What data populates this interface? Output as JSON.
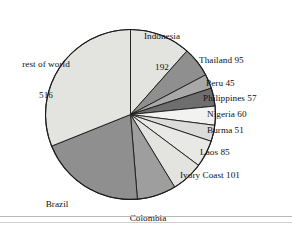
{
  "chart_data": {
    "type": "pie",
    "title": "",
    "subtitle": "",
    "xlabel": "",
    "ylabel": "",
    "legend_position": "none",
    "grid": false,
    "total": 1661,
    "units": "",
    "start_angle_deg": 0,
    "direction": "clockwise",
    "categories": [
      "Indonesia",
      "Thailand",
      "Peru",
      "Philippines",
      "Nigeria",
      "Burma",
      "Laos",
      "Ivory Coast",
      "Colombia",
      "Brazil",
      "rest of world"
    ],
    "values": [
      192,
      95,
      45,
      57,
      60,
      51,
      85,
      101,
      123,
      336,
      516
    ],
    "slice_colors": [
      "#e3e3e0",
      "#8f8f8f",
      "#a8a8a8",
      "#6e6e6e",
      "#f2f2f0",
      "#dcdcda",
      "#e8e8e6",
      "#e3e3e0",
      "#9e9e9e",
      "#8f8f8f",
      "#e3e3e0"
    ],
    "slice_edge_color": "#1a1a1a"
  },
  "labels": [
    {
      "name": "Indonesia",
      "value": "192",
      "line1": "Indonesia",
      "line2": "192"
    },
    {
      "name": "Thailand",
      "value": "95",
      "line1": "Thailand 95",
      "line2": ""
    },
    {
      "name": "Peru",
      "value": "45",
      "line1": "Peru 45",
      "line2": ""
    },
    {
      "name": "Philippines",
      "value": "57",
      "line1": "Philippines 57",
      "line2": ""
    },
    {
      "name": "Nigeria",
      "value": "60",
      "line1": "Nigeria 60",
      "line2": ""
    },
    {
      "name": "Burma",
      "value": "51",
      "line1": "Burma 51",
      "line2": ""
    },
    {
      "name": "Laos",
      "value": "85",
      "line1": "Laos 85",
      "line2": ""
    },
    {
      "name": "Ivory Coast",
      "value": "101",
      "line1": "Ivory Coast 101",
      "line2": ""
    },
    {
      "name": "Colombia",
      "value": "123",
      "line1": "Colombia",
      "line2": "123"
    },
    {
      "name": "Brazil",
      "value": "336",
      "line1": "Brazil",
      "line2": "336"
    },
    {
      "name": "rest of world",
      "value": "516",
      "line1": "rest of world",
      "line2": "516"
    }
  ],
  "colors": {
    "background": "#ffffff",
    "text": "#111111",
    "rule": "#b9b9b9",
    "outline": "#1a1a1a"
  }
}
